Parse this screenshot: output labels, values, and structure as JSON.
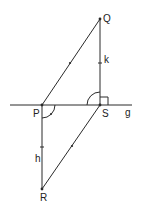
{
  "diagram": {
    "points": {
      "Q": "Q",
      "P": "P",
      "S": "S",
      "R": "R"
    },
    "line_label": "g",
    "segment_labels": {
      "QS": "k",
      "PR": "h"
    },
    "colors": {
      "stroke": "#2a2a2a",
      "text": "#222222"
    }
  }
}
